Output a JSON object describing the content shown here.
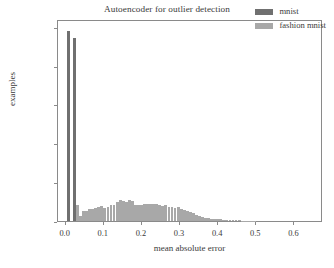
{
  "chart_data": {
    "type": "bar",
    "title": "Autoencoder for outlier detection",
    "xlabel": "mean absolute error",
    "ylabel": "examples",
    "xlim": [
      -0.02,
      0.675
    ],
    "ylim": [
      0,
      5200
    ],
    "xticks": [
      0.0,
      0.1,
      0.2,
      0.3,
      0.4,
      0.5,
      0.6
    ],
    "xticklabels": [
      "0.0",
      "0.1",
      "0.2",
      "0.3",
      "0.4",
      "0.5",
      "0.6"
    ],
    "yticks": [
      0,
      1000,
      2000,
      3000,
      4000,
      5000
    ],
    "yticklabels": [
      "0",
      "1000",
      "2000",
      "3000",
      "4000",
      "5000"
    ],
    "grid": false,
    "legend_position": "upper right",
    "bar_width": 0.0075,
    "series": [
      {
        "name": "mnist",
        "color": "#707070",
        "x": [
          0.008,
          0.023
        ],
        "values": [
          4900,
          4700
        ]
      },
      {
        "name": "fashion mnist",
        "color": "#a8a8a8",
        "x": [
          0.031,
          0.039,
          0.047,
          0.055,
          0.063,
          0.071,
          0.079,
          0.087,
          0.095,
          0.103,
          0.111,
          0.119,
          0.127,
          0.135,
          0.143,
          0.151,
          0.159,
          0.167,
          0.175,
          0.183,
          0.191,
          0.199,
          0.207,
          0.215,
          0.223,
          0.231,
          0.239,
          0.247,
          0.255,
          0.263,
          0.271,
          0.279,
          0.287,
          0.295,
          0.303,
          0.311,
          0.319,
          0.327,
          0.335,
          0.343,
          0.351,
          0.359,
          0.367,
          0.375,
          0.383,
          0.391,
          0.399,
          0.407,
          0.415,
          0.423,
          0.431,
          0.439,
          0.447,
          0.455,
          0.463,
          0.471,
          0.479,
          0.487,
          0.495
        ],
        "values": [
          410,
          120,
          250,
          265,
          300,
          320,
          345,
          355,
          380,
          340,
          370,
          420,
          420,
          490,
          545,
          520,
          500,
          530,
          525,
          425,
          410,
          420,
          435,
          430,
          440,
          450,
          430,
          400,
          390,
          415,
          370,
          360,
          330,
          350,
          300,
          280,
          250,
          225,
          195,
          145,
          130,
          110,
          90,
          75,
          60,
          55,
          45,
          40,
          32,
          26,
          22,
          20,
          16,
          14,
          11,
          9,
          7,
          6,
          5
        ]
      }
    ]
  },
  "legend": {
    "entries": [
      {
        "label": "mnist",
        "color": "#707070"
      },
      {
        "label": "fashion mnist",
        "color": "#a8a8a8"
      }
    ]
  }
}
